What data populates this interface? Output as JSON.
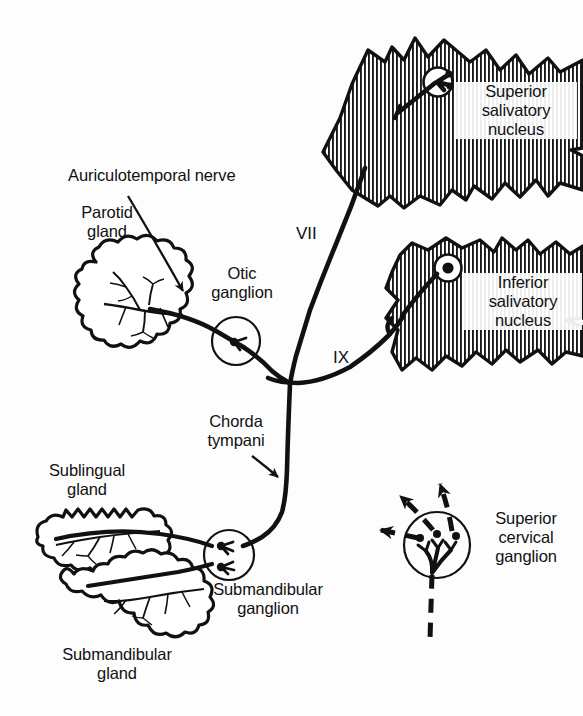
{
  "figure": {
    "background_color": "#fdfdfd",
    "ink_color": "#111111"
  },
  "labels": {
    "auriculotemporal_nerve": "Auriculotemporal nerve",
    "parotid_gland": "Parotid\ngland",
    "otic_ganglion": "Otic\nganglion",
    "superior_salivatory_nucleus": "Superior\nsalivatory\nnucleus",
    "inferior_salivatory_nucleus": "Inferior\nsalivatory\nnucleus",
    "chorda_tympani": "Chorda\ntympani",
    "sublingual_gland": "Sublingual\ngland",
    "submandibular_ganglion": "Submandibular\nganglion",
    "submandibular_gland": "Submandibular\ngland",
    "superior_cervical_ganglion": "Superior\ncervical\nganglion",
    "nerve_vii": "VII",
    "nerve_ix": "IX"
  },
  "structures": [
    {
      "name": "superior-salivatory-nucleus-brainstem",
      "kind": "hatched-brainstem-section"
    },
    {
      "name": "inferior-salivatory-nucleus-brainstem",
      "kind": "hatched-brainstem-section"
    },
    {
      "name": "parotid-gland",
      "kind": "lobulated-gland"
    },
    {
      "name": "sublingual-gland",
      "kind": "lobulated-gland"
    },
    {
      "name": "submandibular-gland",
      "kind": "lobulated-gland"
    },
    {
      "name": "otic-ganglion",
      "kind": "ganglion-circle"
    },
    {
      "name": "submandibular-ganglion",
      "kind": "ganglion-circle"
    },
    {
      "name": "superior-cervical-ganglion",
      "kind": "ganglion-circle"
    }
  ],
  "pathways": [
    {
      "name": "facial-nerve-vii",
      "style": "solid",
      "label": "VII"
    },
    {
      "name": "glossopharyngeal-nerve-ix",
      "style": "solid",
      "label": "IX"
    },
    {
      "name": "chorda-tympani",
      "style": "solid"
    },
    {
      "name": "auriculotemporal-nerve",
      "style": "solid"
    },
    {
      "name": "sympathetic-fibers",
      "style": "dashed"
    }
  ]
}
